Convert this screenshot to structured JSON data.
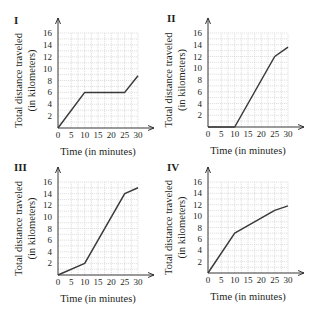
{
  "figure": {
    "panels": [
      {
        "label": "I",
        "xlabel": "Time (in minutes)",
        "ylabel_line1": "Total distance traveled",
        "ylabel_line2": "(in kilometers)"
      },
      {
        "label": "II",
        "xlabel": "Time (in minutes)",
        "ylabel_line1": "Total distance traveled",
        "ylabel_line2": "(in kilometers)"
      },
      {
        "label": "III",
        "xlabel": "Time (in minutes)",
        "ylabel_line1": "Total distance traveled",
        "ylabel_line2": "(in kilometers)"
      },
      {
        "label": "IV",
        "xlabel": "Time (in minutes)",
        "ylabel_line1": "Total distance traveled",
        "ylabel_line2": "(in kilometers)"
      }
    ],
    "x_ticks": [
      "0",
      "5",
      "10",
      "15",
      "20",
      "25",
      "30"
    ],
    "y_ticks": [
      "2",
      "4",
      "6",
      "8",
      "10",
      "12",
      "14",
      "16"
    ],
    "colors": {
      "line": "#3a3a3a",
      "axis": "#231f20",
      "grid": "#d4d4d4"
    }
  },
  "chart_data": [
    {
      "type": "line",
      "title": "I",
      "xlabel": "Time (in minutes)",
      "ylabel": "Total distance traveled (in kilometers)",
      "xlim": [
        0,
        30
      ],
      "ylim": [
        0,
        16
      ],
      "x_ticks": [
        0,
        5,
        10,
        15,
        20,
        25,
        30
      ],
      "y_ticks": [
        2,
        4,
        6,
        8,
        10,
        12,
        14,
        16
      ],
      "grid": true,
      "legend": null,
      "series": [
        {
          "name": "I",
          "x": [
            0,
            10,
            25,
            30
          ],
          "y": [
            0,
            6,
            6,
            8.8
          ]
        }
      ]
    },
    {
      "type": "line",
      "title": "II",
      "xlabel": "Time (in minutes)",
      "ylabel": "Total distance traveled (in kilometers)",
      "xlim": [
        0,
        30
      ],
      "ylim": [
        0,
        16
      ],
      "x_ticks": [
        0,
        5,
        10,
        15,
        20,
        25,
        30
      ],
      "y_ticks": [
        2,
        4,
        6,
        8,
        10,
        12,
        14,
        16
      ],
      "grid": true,
      "legend": null,
      "series": [
        {
          "name": "II",
          "x": [
            0,
            10,
            25,
            30
          ],
          "y": [
            0,
            0,
            12,
            13.6
          ]
        }
      ]
    },
    {
      "type": "line",
      "title": "III",
      "xlabel": "Time (in minutes)",
      "ylabel": "Total distance traveled (in kilometers)",
      "xlim": [
        0,
        30
      ],
      "ylim": [
        0,
        16
      ],
      "x_ticks": [
        0,
        5,
        10,
        15,
        20,
        25,
        30
      ],
      "y_ticks": [
        2,
        4,
        6,
        8,
        10,
        12,
        14,
        16
      ],
      "grid": true,
      "legend": null,
      "series": [
        {
          "name": "III",
          "x": [
            0,
            10,
            25,
            30
          ],
          "y": [
            0,
            2,
            14,
            15
          ]
        }
      ]
    },
    {
      "type": "line",
      "title": "IV",
      "xlabel": "Time (in minutes)",
      "ylabel": "Total distance traveled (in kilometers)",
      "xlim": [
        0,
        30
      ],
      "ylim": [
        0,
        16
      ],
      "x_ticks": [
        0,
        5,
        10,
        15,
        20,
        25,
        30
      ],
      "y_ticks": [
        2,
        4,
        6,
        8,
        10,
        12,
        14,
        16
      ],
      "grid": true,
      "legend": null,
      "series": [
        {
          "name": "IV",
          "x": [
            0,
            10,
            25,
            30
          ],
          "y": [
            0,
            7,
            11,
            11.8
          ]
        }
      ]
    }
  ]
}
